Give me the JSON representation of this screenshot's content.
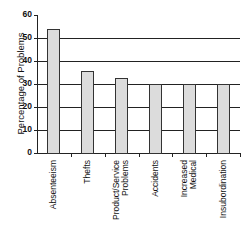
{
  "chart_data": {
    "type": "bar",
    "title": "",
    "xlabel": "",
    "ylabel": "Percentage of Problems",
    "ylim": [
      0,
      60
    ],
    "yticks": [
      0,
      10,
      20,
      30,
      40,
      50,
      60
    ],
    "grid": true,
    "legend": null,
    "categories": [
      "Absenteeism",
      "Thefts",
      "Product/Service Problems",
      "Accidents",
      "Increased Medical",
      "Insubordination"
    ],
    "values": [
      54,
      35.5,
      32.5,
      30,
      30,
      30
    ],
    "category_label_lines": [
      [
        "Absenteeism"
      ],
      [
        "Thefts"
      ],
      [
        "Product/Service",
        "Problems"
      ],
      [
        "Accidents"
      ],
      [
        "Increased",
        "Medical"
      ],
      [
        "Insubordination"
      ]
    ]
  },
  "ui": {
    "ytick_labels": [
      "0",
      "10",
      "20",
      "30",
      "40",
      "50",
      "60"
    ],
    "colors": {
      "bar_fill": "#dcdcdc",
      "bar_border": "#333333",
      "axis": "#222222"
    }
  }
}
